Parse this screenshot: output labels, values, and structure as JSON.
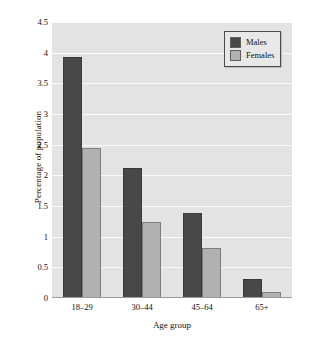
{
  "chart_data": {
    "type": "bar",
    "title": "",
    "xlabel": "Age group",
    "ylabel": "Percentage of population",
    "categories": [
      "18–29",
      "30–44",
      "45–64",
      "65+"
    ],
    "series": [
      {
        "name": "Males",
        "color": "#484848",
        "values": [
          3.93,
          2.12,
          1.39,
          0.31
        ]
      },
      {
        "name": "Females",
        "color": "#b1b1b1",
        "values": [
          2.45,
          1.24,
          0.82,
          0.1
        ]
      }
    ],
    "ylim": [
      0,
      4.5
    ],
    "yticks": [
      "0",
      "0.5",
      "1",
      "1.5",
      "2",
      "2.5",
      "3",
      "3.5",
      "4",
      "4.5"
    ],
    "ytick_values": [
      0,
      0.5,
      1,
      1.5,
      2,
      2.5,
      3,
      3.5,
      4,
      4.5
    ],
    "grid": true,
    "legend_position": "top-right",
    "plot_background": "#e3e3e3",
    "gridline_color": "#fbfbfb"
  },
  "legend": {
    "entries": [
      {
        "label": "Males"
      },
      {
        "label": "Females"
      }
    ]
  }
}
